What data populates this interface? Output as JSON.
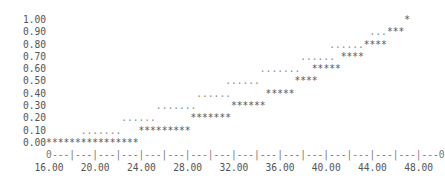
{
  "chart_data": {
    "type": "line",
    "style": "ascii step plot (empirical CDF)",
    "title": "",
    "xlabel": "",
    "ylabel": "",
    "xlim": [
      16,
      48
    ],
    "ylim": [
      0,
      1
    ],
    "x_ticks": [
      "16.00",
      "20.00",
      "24.00",
      "28.00",
      "32.00",
      "36.00",
      "40.00",
      "44.00",
      "48.00"
    ],
    "y_ticks": [
      "1.00",
      "0.90",
      "0.80",
      "0.70",
      "0.60",
      "0.50",
      "0.40",
      "0.30",
      "0.20",
      "0.10",
      "0.00"
    ],
    "grid": false,
    "legend": null,
    "series": [
      {
        "name": "step",
        "marker": "*",
        "points": [
          {
            "y": 0.0,
            "x_from": 16.0,
            "x_to": 23.5
          },
          {
            "y": 0.1,
            "x_from": 24.0,
            "x_to": 28.0
          },
          {
            "y": 0.2,
            "x_from": 28.5,
            "x_to": 31.5
          },
          {
            "y": 0.3,
            "x_from": 32.0,
            "x_to": 34.5
          },
          {
            "y": 0.4,
            "x_from": 35.0,
            "x_to": 37.0
          },
          {
            "y": 0.5,
            "x_from": 37.5,
            "x_to": 39.0
          },
          {
            "y": 0.6,
            "x_from": 39.5,
            "x_to": 41.5
          },
          {
            "y": 0.7,
            "x_from": 41.5,
            "x_to": 43.0
          },
          {
            "y": 0.8,
            "x_from": 43.5,
            "x_to": 45.0
          },
          {
            "y": 0.9,
            "x_from": 45.5,
            "x_to": 46.5
          },
          {
            "y": 1.0,
            "x_from": 47.0,
            "x_to": 47.0
          }
        ]
      },
      {
        "name": "reference",
        "marker": ".",
        "points": [
          {
            "y": 0.1,
            "x_from": 19.0,
            "x_to": 22.0
          },
          {
            "y": 0.2,
            "x_from": 22.5,
            "x_to": 25.0
          },
          {
            "y": 0.3,
            "x_from": 25.5,
            "x_to": 28.5
          },
          {
            "y": 0.4,
            "x_from": 29.0,
            "x_to": 31.5
          },
          {
            "y": 0.5,
            "x_from": 31.5,
            "x_to": 34.0
          },
          {
            "y": 0.6,
            "x_from": 34.5,
            "x_to": 37.5
          },
          {
            "y": 0.7,
            "x_from": 38.0,
            "x_to": 40.5
          },
          {
            "y": 0.8,
            "x_from": 40.5,
            "x_to": 43.0
          },
          {
            "y": 0.9,
            "x_from": 44.0,
            "x_to": 45.0
          }
        ]
      }
    ]
  },
  "plot": {
    "rows": [
      {
        "label": "1.00",
        "dots": [],
        "stars": [
          62,
          62
        ]
      },
      {
        "label": "0.90",
        "dots": [
          56,
          58
        ],
        "stars": [
          59,
          61
        ]
      },
      {
        "label": "0.80",
        "dots": [
          49,
          54
        ],
        "stars": [
          55,
          58
        ]
      },
      {
        "label": "0.70",
        "dots": [
          44,
          49
        ],
        "stars": [
          51,
          54
        ]
      },
      {
        "label": "0.60",
        "dots": [
          37,
          43
        ],
        "stars": [
          46,
          50
        ]
      },
      {
        "label": "0.50",
        "dots": [
          31,
          36
        ],
        "stars": [
          43,
          46
        ]
      },
      {
        "label": "0.40",
        "dots": [
          26,
          31
        ],
        "stars": [
          38,
          42
        ]
      },
      {
        "label": "0.30",
        "dots": [
          19,
          25
        ],
        "stars": [
          32,
          37
        ]
      },
      {
        "label": "0.20",
        "dots": [
          13,
          18
        ],
        "stars": [
          25,
          31
        ]
      },
      {
        "label": "0.10",
        "dots": [
          6,
          12
        ],
        "stars": [
          16,
          24
        ]
      },
      {
        "label": "0.00",
        "dots": [],
        "stars": [
          0,
          15
        ]
      }
    ],
    "axis_line": "    0---|---|---|---|---|---|---|---|---|---|---|---|---|---|---|---|---0",
    "x_label_line": "  16.00   20.00   24.00   28.00   32.00   36.00   40.00   44.00   48.00"
  }
}
